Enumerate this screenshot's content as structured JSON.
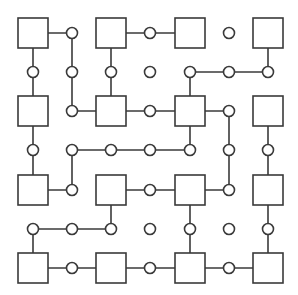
{
  "diagram": {
    "colors": {
      "stroke": "#3a3a3a",
      "fill": "#ffffff",
      "background": "#ffffff"
    },
    "grid": {
      "coords_x": [
        33,
        72,
        111,
        150,
        190,
        229,
        268
      ],
      "coords_y": [
        33,
        72,
        111,
        150,
        190,
        229,
        268
      ],
      "square_half": 15,
      "circle_radius": 5.5
    },
    "squares": [
      [
        0,
        0
      ],
      [
        0,
        2
      ],
      [
        0,
        4
      ],
      [
        0,
        6
      ],
      [
        2,
        0
      ],
      [
        2,
        2
      ],
      [
        2,
        4
      ],
      [
        2,
        6
      ],
      [
        4,
        0
      ],
      [
        4,
        2
      ],
      [
        4,
        4
      ],
      [
        4,
        6
      ],
      [
        6,
        0
      ],
      [
        6,
        2
      ],
      [
        6,
        4
      ],
      [
        6,
        6
      ]
    ],
    "circles": [
      [
        0,
        1
      ],
      [
        0,
        3
      ],
      [
        0,
        5
      ],
      [
        1,
        0
      ],
      [
        1,
        1
      ],
      [
        1,
        2
      ],
      [
        1,
        3
      ],
      [
        1,
        4
      ],
      [
        1,
        5
      ],
      [
        1,
        6
      ],
      [
        2,
        1
      ],
      [
        2,
        3
      ],
      [
        2,
        5
      ],
      [
        3,
        0
      ],
      [
        3,
        1
      ],
      [
        3,
        2
      ],
      [
        3,
        3
      ],
      [
        3,
        4
      ],
      [
        3,
        5
      ],
      [
        3,
        6
      ],
      [
        4,
        1
      ],
      [
        4,
        3
      ],
      [
        4,
        5
      ],
      [
        5,
        0
      ],
      [
        5,
        1
      ],
      [
        5,
        2
      ],
      [
        5,
        3
      ],
      [
        5,
        4
      ],
      [
        5,
        5
      ],
      [
        5,
        6
      ],
      [
        6,
        1
      ],
      [
        6,
        3
      ],
      [
        6,
        5
      ]
    ],
    "edges": [
      [
        [
          0,
          0
        ],
        [
          0,
          1
        ]
      ],
      [
        [
          0,
          2
        ],
        [
          0,
          3
        ]
      ],
      [
        [
          0,
          3
        ],
        [
          0,
          4
        ]
      ],
      [
        [
          1,
          4
        ],
        [
          1,
          5
        ]
      ],
      [
        [
          1,
          5
        ],
        [
          1,
          6
        ]
      ],
      [
        [
          2,
          1
        ],
        [
          2,
          2
        ]
      ],
      [
        [
          2,
          2
        ],
        [
          2,
          3
        ]
      ],
      [
        [
          2,
          3
        ],
        [
          2,
          4
        ]
      ],
      [
        [
          2,
          4
        ],
        [
          2,
          5
        ]
      ],
      [
        [
          3,
          1
        ],
        [
          3,
          2
        ]
      ],
      [
        [
          3,
          2
        ],
        [
          3,
          3
        ]
      ],
      [
        [
          3,
          3
        ],
        [
          3,
          4
        ]
      ],
      [
        [
          4,
          0
        ],
        [
          4,
          1
        ]
      ],
      [
        [
          4,
          2
        ],
        [
          4,
          3
        ]
      ],
      [
        [
          4,
          3
        ],
        [
          4,
          4
        ]
      ],
      [
        [
          4,
          4
        ],
        [
          4,
          5
        ]
      ],
      [
        [
          5,
          0
        ],
        [
          5,
          1
        ]
      ],
      [
        [
          5,
          1
        ],
        [
          5,
          2
        ]
      ],
      [
        [
          6,
          0
        ],
        [
          6,
          1
        ]
      ],
      [
        [
          6,
          1
        ],
        [
          6,
          2
        ]
      ],
      [
        [
          6,
          2
        ],
        [
          6,
          3
        ]
      ],
      [
        [
          6,
          3
        ],
        [
          6,
          4
        ]
      ],
      [
        [
          6,
          4
        ],
        [
          6,
          5
        ]
      ],
      [
        [
          6,
          5
        ],
        [
          6,
          6
        ]
      ],
      [
        [
          0,
          0
        ],
        [
          1,
          0
        ]
      ],
      [
        [
          1,
          0
        ],
        [
          2,
          0
        ]
      ],
      [
        [
          2,
          0
        ],
        [
          3,
          0
        ]
      ],
      [
        [
          3,
          0
        ],
        [
          4,
          0
        ]
      ],
      [
        [
          5,
          0
        ],
        [
          6,
          0
        ]
      ],
      [
        [
          0,
          1
        ],
        [
          1,
          1
        ]
      ],
      [
        [
          1,
          1
        ],
        [
          2,
          1
        ]
      ],
      [
        [
          3,
          1
        ],
        [
          4,
          1
        ]
      ],
      [
        [
          0,
          2
        ],
        [
          1,
          2
        ]
      ],
      [
        [
          1,
          2
        ],
        [
          2,
          2
        ]
      ],
      [
        [
          4,
          2
        ],
        [
          5,
          2
        ]
      ],
      [
        [
          1,
          4
        ],
        [
          2,
          4
        ]
      ],
      [
        [
          2,
          4
        ],
        [
          3,
          4
        ]
      ],
      [
        [
          4,
          4
        ],
        [
          5,
          4
        ]
      ],
      [
        [
          5,
          4
        ],
        [
          6,
          4
        ]
      ],
      [
        [
          2,
          5
        ],
        [
          3,
          5
        ]
      ],
      [
        [
          3,
          5
        ],
        [
          4,
          5
        ]
      ],
      [
        [
          0,
          6
        ],
        [
          1,
          6
        ]
      ],
      [
        [
          2,
          6
        ],
        [
          3,
          6
        ]
      ],
      [
        [
          3,
          6
        ],
        [
          4,
          6
        ]
      ],
      [
        [
          4,
          6
        ],
        [
          5,
          6
        ]
      ],
      [
        [
          5,
          6
        ],
        [
          6,
          6
        ]
      ]
    ]
  }
}
